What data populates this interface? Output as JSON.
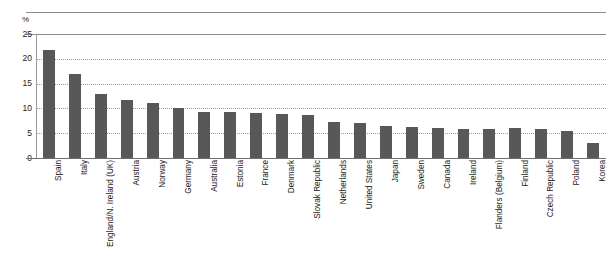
{
  "chart_data": {
    "type": "bar",
    "title": "",
    "subtitle": "",
    "xlabel": "",
    "ylabel": "%",
    "unit_label": "%",
    "ylim": [
      0,
      25
    ],
    "ytick_labels": [
      "0",
      "5",
      "10",
      "15",
      "20",
      "25"
    ],
    "ytick_values": [
      0,
      5,
      10,
      15,
      20,
      25
    ],
    "grid": "horizontal-dotted",
    "legend": "none",
    "bar_color": "#585858",
    "categories": [
      "Spain",
      "Italy",
      "England/N. Ireland (UK)",
      "Austria",
      "Norway",
      "Germany",
      "Australia",
      "Estonia",
      "France",
      "Denmark",
      "Slovak Republic",
      "Netherlands",
      "United States",
      "Japan",
      "Sweden",
      "Canada",
      "Ireland",
      "Flanders (Belgium)",
      "Finland",
      "Czech Republic",
      "Poland",
      "Korea"
    ],
    "values": [
      21.8,
      17.0,
      13.0,
      11.7,
      11.0,
      10.0,
      9.3,
      9.2,
      9.0,
      8.8,
      8.6,
      7.3,
      7.0,
      6.4,
      6.2,
      6.0,
      5.9,
      5.9,
      6.0,
      5.8,
      5.4,
      3.0
    ]
  },
  "axis": {
    "unit": "%"
  }
}
